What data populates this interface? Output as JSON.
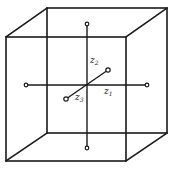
{
  "diagram": {
    "type": "cube-with-axes",
    "colors": {
      "line": "#1a1a1a",
      "background": "#ffffff"
    },
    "cube": {
      "front_face": {
        "x1": 6,
        "y1": 37,
        "x2": 126,
        "y2": 161
      },
      "back_face": {
        "x1": 47,
        "y1": 8,
        "x2": 167,
        "y2": 133
      }
    },
    "center": {
      "x": 87,
      "y": 85
    },
    "axes": [
      {
        "id": "z1",
        "label": "z",
        "subscript": "1",
        "from": [
          26,
          85
        ],
        "to": [
          147,
          85
        ]
      },
      {
        "id": "z2",
        "label": "z",
        "subscript": "2",
        "from": [
          87,
          24
        ],
        "to": [
          87,
          148
        ]
      },
      {
        "id": "z3",
        "label": "z",
        "subscript": "3",
        "from": [
          66,
          99
        ],
        "to": [
          108,
          70
        ]
      }
    ]
  }
}
